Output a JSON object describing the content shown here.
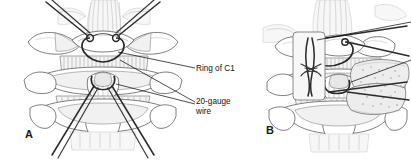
{
  "figure": {
    "background_color": "#ffffff",
    "width": 411,
    "height": 161,
    "style": "grayscale-line-art-medical-illustration"
  },
  "panels": [
    {
      "id": "A",
      "label": "A",
      "description": "Posterior view of C1-C2 with 20-gauge wire passed sublaminar under the ring of C1 and around the C2 spinous process"
    },
    {
      "id": "B",
      "label": "B",
      "description": "Posterior view with corticocancellous bone graft secured against C1-C2 by the twisted wire, with inset detail of the wire twist"
    }
  ],
  "callouts": [
    {
      "name": "ring-of-c1",
      "text": "Ring of C1",
      "lines": [
        "Ring of C1"
      ],
      "x": 196,
      "y": 64
    },
    {
      "name": "twenty-gauge-wire",
      "text": "20-gauge wire",
      "lines": [
        "20-gauge",
        "wire"
      ],
      "x": 196,
      "y": 97
    }
  ],
  "colors": {
    "background": "#ffffff",
    "bone_outline": "#545454",
    "bone_fill": "#ffffff",
    "bone_shade": "#e8e8e8",
    "wire": "#2a2a2a",
    "leader_line": "#111111",
    "text": "#121212",
    "graft_fill": "#ededed",
    "hatch": "#8b8b8b",
    "soft_tissue": "#bdbdbd"
  }
}
